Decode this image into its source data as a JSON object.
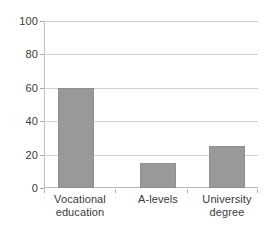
{
  "chart_data": {
    "type": "bar",
    "title": "",
    "subtitle": "",
    "xlabel": "",
    "ylabel": "",
    "categories": [
      "Vocational education",
      "A-levels",
      "University degree"
    ],
    "category_lines": [
      [
        "Vocational",
        "education"
      ],
      [
        "A-levels",
        ""
      ],
      [
        "University",
        "degree"
      ]
    ],
    "values": [
      60,
      15,
      25
    ],
    "ylim": [
      0,
      100
    ],
    "ytick_labels": [
      "0",
      "20",
      "40",
      "60",
      "80",
      "100"
    ],
    "ytick_values": [
      0,
      20,
      40,
      60,
      80,
      100
    ],
    "grid": "horizontal",
    "legend": "none",
    "bar_color": "#999999",
    "bar_border_color": "#8f8f8f",
    "gridline_color": "#d0d0d0",
    "axis_color": "#b8b8b8",
    "text_color": "#3a3a3a",
    "background_color": "#ffffff"
  }
}
